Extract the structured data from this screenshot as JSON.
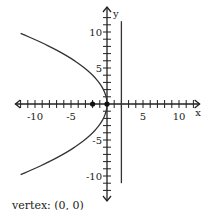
{
  "chart_data": {
    "type": "line",
    "title": "",
    "xlabel": "x",
    "ylabel": "y",
    "xlim": [
      -13,
      13
    ],
    "ylim": [
      -13,
      13
    ],
    "xticks": [
      -10,
      -5,
      5,
      10
    ],
    "yticks": [
      10,
      5,
      -5,
      -10
    ],
    "xtick_labels": [
      "-10",
      "-5",
      "5",
      "10"
    ],
    "ytick_labels": [
      "10",
      "5",
      "-5",
      "-10"
    ],
    "minor_tick_step": 1,
    "grid": false,
    "series": [
      {
        "name": "parabola",
        "equation": "y^2 = -8x",
        "x_range": [
          -12,
          0
        ],
        "color": "#333333"
      },
      {
        "name": "directrix",
        "equation": "x = 2",
        "y_range": [
          -11,
          11.5
        ],
        "color": "#333333"
      }
    ],
    "points": [
      {
        "name": "focus",
        "x": -2,
        "y": 0
      },
      {
        "name": "vertex",
        "x": 0,
        "y": 0
      }
    ]
  },
  "caption": "vertex: (0, 0)"
}
